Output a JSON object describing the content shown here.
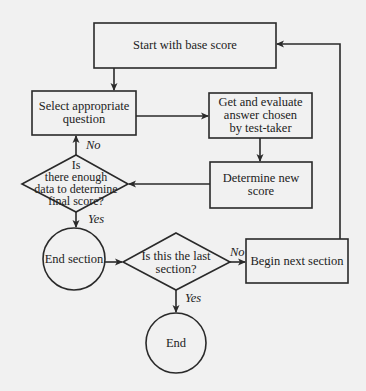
{
  "colors": {
    "background": "#f1f1f1",
    "stroke": "#2a2a2a",
    "text": "#222222"
  },
  "nodes": {
    "start": {
      "label": "Start with base score",
      "shape": "rectangle"
    },
    "select": {
      "label": "Select appropriate\nquestion",
      "shape": "rectangle"
    },
    "evaluate": {
      "label": "Get and evaluate\nanswer chosen\nby test-taker",
      "shape": "rectangle"
    },
    "determine": {
      "label": "Determine new\nscore",
      "shape": "rectangle"
    },
    "enough_data": {
      "label": "Is\nthere enough\ndata to determine\nfinal score?",
      "shape": "diamond"
    },
    "end_section": {
      "label": "End section",
      "shape": "circle"
    },
    "last_section": {
      "label": "Is this the last\nsection?",
      "shape": "diamond"
    },
    "next_section": {
      "label": "Begin next section",
      "shape": "rectangle"
    },
    "end": {
      "label": "End",
      "shape": "circle"
    }
  },
  "edges": {
    "enough_no": "No",
    "enough_yes": "Yes",
    "last_no": "No",
    "last_yes": "Yes"
  }
}
